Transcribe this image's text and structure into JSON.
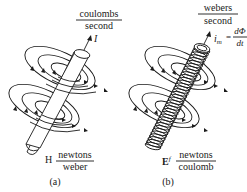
{
  "panels": [
    {
      "id": "a",
      "caption": "(a)",
      "source_label": "I",
      "source_units": {
        "numerator": "coulombs",
        "denominator": "second"
      },
      "field_label": "H",
      "field_units": {
        "numerator": "newtons",
        "denominator": "weber"
      },
      "conductor": "solid-rod"
    },
    {
      "id": "b",
      "caption": "(b)",
      "source_label": "i",
      "source_subscript": "m",
      "source_equation": {
        "equals": "=",
        "numerator": "dΦ",
        "denominator": "dt"
      },
      "source_units": {
        "numerator": "webers",
        "denominator": "second"
      },
      "field_label": "E",
      "field_superscript": "f",
      "field_units": {
        "numerator": "newtons",
        "denominator": "coulomb"
      },
      "conductor": "coiled-rod"
    }
  ]
}
